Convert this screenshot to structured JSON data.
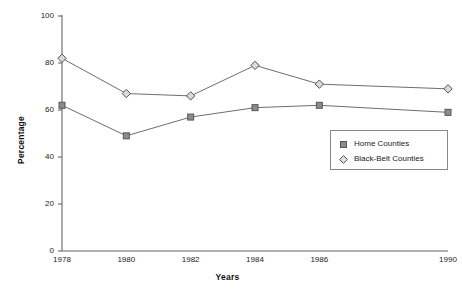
{
  "chart_data": {
    "type": "line",
    "title": "",
    "xlabel": "Years",
    "ylabel": "Percentage",
    "categories": [
      "1978",
      "1980",
      "1982",
      "1984",
      "1986",
      "1990"
    ],
    "x": [
      1978,
      1980,
      1982,
      1984,
      1986,
      1990
    ],
    "series": [
      {
        "name": "Home Counties",
        "marker": "square",
        "color": "#8c8c8c",
        "line_color": "#6e6e6e",
        "values": [
          62,
          49,
          57,
          61,
          62,
          59
        ]
      },
      {
        "name": "Black-Belt Counties",
        "marker": "diamond",
        "color": "#d9d9d9",
        "line_color": "#6e6e6e",
        "values": [
          82,
          67,
          66,
          79,
          71,
          69
        ]
      }
    ],
    "ylim": [
      0,
      100
    ],
    "yticks": [
      0,
      20,
      40,
      60,
      80,
      100
    ],
    "ytick_labels": [
      "0",
      "20",
      "40",
      "60",
      "80",
      "100"
    ],
    "xtick_labels": [
      "1978",
      "1980",
      "1982",
      "1984",
      "1986",
      "1990"
    ],
    "grid": false,
    "legend_position": "inside-lower-right",
    "axis_color": "#666666"
  },
  "legend": {
    "entries": [
      {
        "label": "Home Counties"
      },
      {
        "label": "Black-Belt Counties"
      }
    ]
  },
  "axes": {
    "x_title": "Years",
    "y_title": "Percentage"
  }
}
